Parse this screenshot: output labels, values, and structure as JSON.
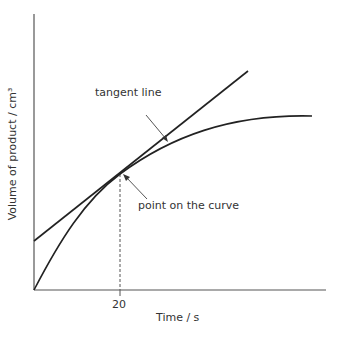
{
  "diagram": {
    "y_axis_label": "Volume of product / cm³",
    "x_axis_label": "Time / s",
    "x_tick_label": "20",
    "annotations": {
      "tangent": "tangent line",
      "point": "point on the curve"
    },
    "colors": {
      "line": "#222222",
      "axis": "#555555",
      "text": "#333333"
    }
  }
}
